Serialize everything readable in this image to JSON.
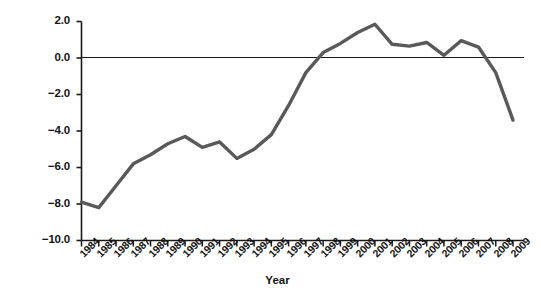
{
  "chart_data": {
    "type": "line",
    "title": "",
    "xlabel": "Year",
    "ylabel": "Federal budget balance (% of output)",
    "categories": [
      "1984",
      "1985",
      "1986",
      "1987",
      "1988",
      "1989",
      "1990",
      "1991",
      "1992",
      "1993",
      "1994",
      "1995",
      "1996",
      "1997",
      "1998",
      "1999",
      "2000",
      "2001",
      "2002",
      "2003",
      "2004",
      "2005",
      "2006",
      "2007",
      "2008",
      "2009"
    ],
    "values": [
      -7.9,
      -8.2,
      -7.0,
      -5.8,
      -5.3,
      -4.7,
      -4.3,
      -4.9,
      -4.6,
      -5.5,
      -5.0,
      -4.2,
      -2.6,
      -0.8,
      0.3,
      0.8,
      1.4,
      1.85,
      0.75,
      0.65,
      0.85,
      0.15,
      0.95,
      0.6,
      -0.8,
      -3.4
    ],
    "ylim": [
      -10.0,
      2.0
    ],
    "yticks": [
      "2.0",
      "0.0",
      "-2.0",
      "-4.0",
      "-6.0",
      "-8.0",
      "-10.0"
    ],
    "ytick_values": [
      2.0,
      0.0,
      -2.0,
      -4.0,
      -6.0,
      -8.0,
      -10.0
    ],
    "grid": false,
    "legend": "none",
    "series_color": "#595959",
    "axis_color": "#1a1a1a",
    "zero_line": 0.0
  }
}
